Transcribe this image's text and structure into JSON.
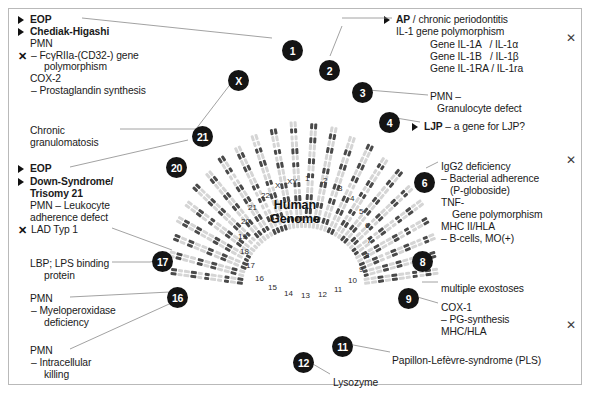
{
  "figure": {
    "center_title_line1": "Human",
    "center_title_line2": "Genome"
  },
  "annotations": {
    "left": [
      {
        "id": "eop-1",
        "bullet": true,
        "bold": true,
        "text": "EOP",
        "x": 30,
        "y": 14
      },
      {
        "id": "chediak-higashi",
        "bullet": true,
        "bold": true,
        "text": "Chediak-Higashi",
        "x": 30,
        "y": 26
      },
      {
        "id": "pmn-1",
        "bullet": false,
        "bold": false,
        "text": "PMN",
        "x": 30,
        "y": 38
      },
      {
        "id": "fcgr2a",
        "bullet": false,
        "xmark": true,
        "bold": false,
        "text": "– FcγRIIa-(CD32-) gene",
        "x": 31,
        "y": 50
      },
      {
        "id": "fcgr2a-cont",
        "bullet": false,
        "bold": false,
        "text": "polymorphism",
        "x": 44,
        "y": 61
      },
      {
        "id": "cox2",
        "bullet": false,
        "bold": false,
        "text": "COX-2",
        "x": 30,
        "y": 73
      },
      {
        "id": "prostaglandin",
        "bullet": false,
        "bold": false,
        "text": "– Prostaglandin synthesis",
        "x": 31,
        "y": 85
      },
      {
        "id": "chronic",
        "bullet": false,
        "bold": false,
        "text": "Chronic",
        "x": 30,
        "y": 125
      },
      {
        "id": "granulomatosis",
        "bullet": false,
        "bold": false,
        "text": "granulomatosis",
        "x": 30,
        "y": 137
      },
      {
        "id": "eop-2",
        "bullet": true,
        "bold": true,
        "text": "EOP",
        "x": 30,
        "y": 163
      },
      {
        "id": "down-syndrome",
        "bullet": true,
        "bold": true,
        "text": "Down-Syndrome/",
        "x": 30,
        "y": 176
      },
      {
        "id": "trisomy21",
        "bullet": false,
        "bold": true,
        "text": "Trisomy 21",
        "x": 30,
        "y": 188
      },
      {
        "id": "pmn-leukocyte",
        "bullet": false,
        "bold": false,
        "text": "PMN – Leukocyte",
        "x": 30,
        "y": 200
      },
      {
        "id": "adherence-defect",
        "bullet": false,
        "bold": false,
        "text": "adherence defect",
        "x": 30,
        "y": 212
      },
      {
        "id": "lad-typ1",
        "bullet": false,
        "xmark": true,
        "bold": false,
        "text": "LAD Typ 1",
        "x": 31,
        "y": 224
      },
      {
        "id": "lbp",
        "bullet": false,
        "bold": false,
        "text": "LBP; LPS binding",
        "x": 30,
        "y": 258
      },
      {
        "id": "lbp-cont",
        "bullet": false,
        "bold": false,
        "text": "protein",
        "x": 44,
        "y": 270
      },
      {
        "id": "pmn-2",
        "bullet": false,
        "bold": false,
        "text": "PMN",
        "x": 30,
        "y": 293
      },
      {
        "id": "myeloperoxidase",
        "bullet": false,
        "bold": false,
        "text": "– Myeloperoxidase",
        "x": 31,
        "y": 305
      },
      {
        "id": "myelo-cont",
        "bullet": false,
        "bold": false,
        "text": "deficiency",
        "x": 44,
        "y": 317
      },
      {
        "id": "pmn-3",
        "bullet": false,
        "bold": false,
        "text": "PMN",
        "x": 30,
        "y": 345
      },
      {
        "id": "intracellular",
        "bullet": false,
        "bold": false,
        "text": "– Intracellular",
        "x": 31,
        "y": 357
      },
      {
        "id": "killing",
        "bullet": false,
        "bold": false,
        "text": "killing",
        "x": 44,
        "y": 369
      }
    ],
    "right": [
      {
        "id": "ap-periodontitis",
        "bullet": true,
        "bold_prefix": "AP",
        "text": " / chronic periodontitis",
        "x": 396,
        "y": 14
      },
      {
        "id": "il1-polymorphism",
        "bullet": false,
        "text": "IL-1 gene polymorphism",
        "x": 396,
        "y": 26
      },
      {
        "id": "gene-il1a",
        "bullet": false,
        "text": "Gene IL-1A   / IL-1α",
        "x": 430,
        "y": 39
      },
      {
        "id": "gene-il1b",
        "bullet": false,
        "text": "Gene IL-1B   / IL-1β",
        "x": 430,
        "y": 51
      },
      {
        "id": "gene-il1ra",
        "bullet": false,
        "text": "Gene IL-1RA / IL-1ra",
        "x": 430,
        "y": 63
      },
      {
        "id": "pmn-granulocyte",
        "bullet": false,
        "text": "PMN –",
        "x": 430,
        "y": 91
      },
      {
        "id": "granulocyte-defect",
        "bullet": false,
        "text": "Granulocyte defect",
        "x": 437,
        "y": 103
      },
      {
        "id": "ljp-gene",
        "bullet": true,
        "bold_prefix": "LJP",
        "text": " – a gene for LJP?",
        "x": 424,
        "y": 121
      },
      {
        "id": "igg2-deficiency",
        "bullet": false,
        "text": "IgG2 deficiency",
        "x": 441,
        "y": 161
      },
      {
        "id": "bacterial-adherence",
        "bullet": false,
        "text": "– Bacterial adherence",
        "x": 441,
        "y": 173
      },
      {
        "id": "p-globoside",
        "bullet": false,
        "text": "(P-globoside)",
        "x": 450,
        "y": 185
      },
      {
        "id": "tnf",
        "bullet": false,
        "text": "TNF-",
        "x": 441,
        "y": 197
      },
      {
        "id": "tnf-polymorphism",
        "bullet": false,
        "text": "Gene polymorphism",
        "x": 452,
        "y": 209
      },
      {
        "id": "mhc2-hla",
        "bullet": false,
        "text": "MHC II/HLA",
        "x": 441,
        "y": 221
      },
      {
        "id": "b-cells",
        "bullet": false,
        "text": "– B-cells, MO(+)",
        "x": 441,
        "y": 233
      },
      {
        "id": "multiple-exostoses",
        "bullet": false,
        "text": "multiple exostoses",
        "x": 441,
        "y": 283
      },
      {
        "id": "cox1",
        "bullet": false,
        "text": "COX-1",
        "x": 441,
        "y": 302
      },
      {
        "id": "pg-synthesis",
        "bullet": false,
        "text": "– PG-synthesis",
        "x": 441,
        "y": 314
      },
      {
        "id": "mhc-hla",
        "bullet": false,
        "text": "MHC/HLA",
        "x": 441,
        "y": 326
      },
      {
        "id": "papillon-lefevre",
        "bullet": false,
        "text": "Papillon-Lefèvre-syndrome (PLS)",
        "x": 392,
        "y": 355
      }
    ],
    "bottom": [
      {
        "id": "lysozyme",
        "text": "Lysozyme",
        "x": 333,
        "y": 377
      }
    ]
  },
  "badges": [
    {
      "id": "badge-1",
      "label": "1",
      "x": 282,
      "y": 40
    },
    {
      "id": "badge-2",
      "label": "2",
      "x": 319,
      "y": 60
    },
    {
      "id": "badge-3",
      "label": "3",
      "x": 352,
      "y": 82
    },
    {
      "id": "badge-4",
      "label": "4",
      "x": 379,
      "y": 112
    },
    {
      "id": "badge-6",
      "label": "6",
      "x": 414,
      "y": 172
    },
    {
      "id": "badge-8",
      "label": "8",
      "x": 412,
      "y": 251
    },
    {
      "id": "badge-9",
      "label": "9",
      "x": 398,
      "y": 288
    },
    {
      "id": "badge-11",
      "label": "11",
      "x": 332,
      "y": 336
    },
    {
      "id": "badge-12",
      "label": "12",
      "x": 293,
      "y": 352
    },
    {
      "id": "badge-16",
      "label": "16",
      "x": 167,
      "y": 287
    },
    {
      "id": "badge-17",
      "label": "17",
      "x": 152,
      "y": 251
    },
    {
      "id": "badge-20",
      "label": "20",
      "x": 166,
      "y": 157
    },
    {
      "id": "badge-21",
      "label": "21",
      "x": 192,
      "y": 126
    },
    {
      "id": "badge-x",
      "label": "X",
      "x": 228,
      "y": 70
    }
  ],
  "close_buttons": [
    {
      "id": "close-1",
      "label": "✕",
      "x": 566,
      "y": 32
    },
    {
      "id": "close-2",
      "label": "✕",
      "x": 566,
      "y": 154
    },
    {
      "id": "close-3",
      "label": "✕",
      "x": 566,
      "y": 319
    }
  ],
  "chromosome_labels": [
    {
      "label": "XY",
      "x": 287,
      "y": 178
    },
    {
      "label": "1",
      "x": 305,
      "y": 175
    },
    {
      "label": "2",
      "x": 323,
      "y": 177
    },
    {
      "label": "3",
      "x": 338,
      "y": 185
    },
    {
      "label": "4",
      "x": 350,
      "y": 195
    },
    {
      "label": "5",
      "x": 359,
      "y": 208
    },
    {
      "label": "6",
      "x": 365,
      "y": 222
    },
    {
      "label": "7",
      "x": 367,
      "y": 237
    },
    {
      "label": "8",
      "x": 365,
      "y": 252
    },
    {
      "label": "9",
      "x": 359,
      "y": 266
    },
    {
      "label": "10",
      "x": 348,
      "y": 277
    },
    {
      "label": "11",
      "x": 334,
      "y": 286
    },
    {
      "label": "12",
      "x": 318,
      "y": 291
    },
    {
      "label": "13",
      "x": 301,
      "y": 292
    },
    {
      "label": "14",
      "x": 284,
      "y": 290
    },
    {
      "label": "15",
      "x": 268,
      "y": 284
    },
    {
      "label": "16",
      "x": 255,
      "y": 275
    },
    {
      "label": "17",
      "x": 246,
      "y": 262
    },
    {
      "label": "18",
      "x": 240,
      "y": 248
    },
    {
      "label": "19",
      "x": 238,
      "y": 233
    },
    {
      "label": "20",
      "x": 241,
      "y": 218
    },
    {
      "label": "21",
      "x": 248,
      "y": 204
    },
    {
      "label": "22",
      "x": 261,
      "y": 192
    },
    {
      "label": "X",
      "x": 275,
      "y": 182
    }
  ],
  "colors": {
    "badge_bg": "#141414",
    "badge_text": "#ffffff",
    "text": "#1a1a1a",
    "frame_border": "#b9b9b9",
    "leader_line": "#8a8a8a",
    "chromosome_dark": "#4a4a4a",
    "chromosome_light": "#d5d5d5"
  }
}
